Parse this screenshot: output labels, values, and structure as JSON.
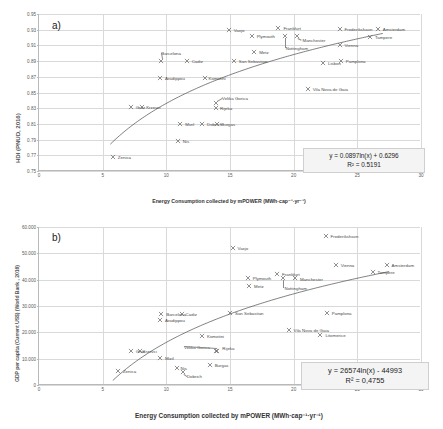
{
  "figure": {
    "width": 443,
    "height": 429,
    "background": "#ffffff",
    "marker_color": "#6b6b6b",
    "curve_color": "#4a4a4a",
    "grid_color": "#d9d9d9"
  },
  "chart_data": [
    {
      "type": "scatter",
      "panel": "a)",
      "title": "",
      "xlabel": "Energy Consumption collected by mPOWER  (MWh·cap⁻¹·yr⁻¹)",
      "ylabel": "HDI (PNUD, 2016)",
      "xlim": [
        0,
        30
      ],
      "ylim": [
        0.75,
        0.95
      ],
      "xticks": [
        0,
        5,
        10,
        15,
        20,
        25,
        30
      ],
      "yticks": [
        0.75,
        0.77,
        0.79,
        0.81,
        0.83,
        0.85,
        0.87,
        0.89,
        0.91,
        0.93,
        0.95
      ],
      "ytick_labels": [
        "0.75",
        "0.77",
        "0.79",
        "0.81",
        "0.83",
        "0.85",
        "0.87",
        "0.89",
        "0.91",
        "0.93",
        "0.95"
      ],
      "grid": true,
      "legend": "none",
      "trend": {
        "kind": "logarithmic",
        "a": 0.0897,
        "b": 0.6296,
        "equation": "y = 0.0897ln(x) + 0.6296",
        "r2_label": "R² = 0.5191",
        "r2": 0.5191,
        "x_start": 5.6,
        "x_end": 27.0
      },
      "points": [
        {
          "label": "Zenica",
          "x": 5.8,
          "y": 0.768,
          "lab_dx": 5,
          "lab_dy": 0
        },
        {
          "label": "Graz",
          "x": 7.2,
          "y": 0.831,
          "lab_dx": 5,
          "lab_dy": 0
        },
        {
          "label": "Krzevci",
          "x": 8.1,
          "y": 0.831,
          "lab_dx": 4,
          "lab_dy": 0
        },
        {
          "label": "Mizil",
          "x": 11.1,
          "y": 0.81,
          "lab_dx": 5,
          "lab_dy": 0
        },
        {
          "label": "Nis",
          "x": 10.9,
          "y": 0.788,
          "lab_dx": 5,
          "lab_dy": 0
        },
        {
          "label": "Dobrich",
          "x": 12.8,
          "y": 0.81,
          "lab_dx": 5,
          "lab_dy": 0
        },
        {
          "label": "Burgas",
          "x": 14.0,
          "y": 0.81,
          "lab_dx": 4,
          "lab_dy": 0
        },
        {
          "label": "Rijeka",
          "x": 13.9,
          "y": 0.83,
          "lab_dx": 4,
          "lab_dy": 0
        },
        {
          "label": "Velika Gorica",
          "x": 13.9,
          "y": 0.836,
          "lab_dx": 6,
          "lab_dy": -5
        },
        {
          "label": "Aradippou",
          "x": 9.5,
          "y": 0.869,
          "lab_dx": 5,
          "lab_dy": 0
        },
        {
          "label": "Komotini",
          "x": 13.0,
          "y": 0.869,
          "lab_dx": 4,
          "lab_dy": 0
        },
        {
          "label": "Barcelona",
          "x": 9.6,
          "y": 0.89,
          "lab_dx": 0,
          "lab_dy": -8
        },
        {
          "label": "Cadiz",
          "x": 11.6,
          "y": 0.89,
          "lab_dx": 5,
          "lab_dy": 0
        },
        {
          "label": "San Sebastian",
          "x": 15.3,
          "y": 0.89,
          "lab_dx": 5,
          "lab_dy": 0
        },
        {
          "label": "Metz",
          "x": 16.9,
          "y": 0.901,
          "lab_dx": 5,
          "lab_dy": 0
        },
        {
          "label": "Vaxjo",
          "x": 14.9,
          "y": 0.93,
          "lab_dx": 5,
          "lab_dy": 0
        },
        {
          "label": "Frankfurt",
          "x": 18.8,
          "y": 0.932,
          "lab_dx": 5,
          "lab_dy": 0
        },
        {
          "label": "Plymouth",
          "x": 16.7,
          "y": 0.922,
          "lab_dx": 5,
          "lab_dy": 0
        },
        {
          "label": "Nottingham",
          "x": 19.3,
          "y": 0.922,
          "lab_dx": 1,
          "lab_dy": 12
        },
        {
          "label": "Manchester",
          "x": 20.3,
          "y": 0.922,
          "lab_dx": 5,
          "lab_dy": 4
        },
        {
          "label": "Frederikshavn",
          "x": 23.6,
          "y": 0.931,
          "lab_dx": 5,
          "lab_dy": 0
        },
        {
          "label": "Amsterdam",
          "x": 26.6,
          "y": 0.931,
          "lab_dx": 5,
          "lab_dy": 0
        },
        {
          "label": "Tampere",
          "x": 26.0,
          "y": 0.921,
          "lab_dx": 5,
          "lab_dy": 0
        },
        {
          "label": "Vienna",
          "x": 23.6,
          "y": 0.91,
          "lab_dx": 5,
          "lab_dy": 0
        },
        {
          "label": "Pamplona",
          "x": 23.7,
          "y": 0.89,
          "lab_dx": 5,
          "lab_dy": 0
        },
        {
          "label": "Lisbon",
          "x": 22.3,
          "y": 0.888,
          "lab_dx": 5,
          "lab_dy": 0
        },
        {
          "label": "Vila Nova de Gaia",
          "x": 21.1,
          "y": 0.855,
          "lab_dx": 5,
          "lab_dy": 0
        }
      ]
    },
    {
      "type": "scatter",
      "panel": "b)",
      "title": "",
      "xlabel": "Energy Consumption collected by mPOWER  (MWh·cap⁻¹·yr⁻¹)",
      "ylabel": "GDP per capita (Current US$) (World Bank , 2016)",
      "xlim": [
        0,
        30
      ],
      "ylim": [
        0,
        60000
      ],
      "xticks": [
        0,
        5,
        10,
        15,
        20,
        25,
        30
      ],
      "yticks": [
        0,
        10000,
        20000,
        30000,
        40000,
        50000,
        60000
      ],
      "ytick_labels": [
        "0",
        "10.000",
        "20.000",
        "30.000",
        "40.000",
        "50.000",
        "60.000"
      ],
      "grid": true,
      "legend": "none",
      "trend": {
        "kind": "logarithmic",
        "a": 26574,
        "b": -44993,
        "equation": "y = 26574ln(x) - 44993",
        "r2_label": "R² = 0,4755",
        "r2": 0.4755,
        "x_start": 5.8,
        "x_end": 27.5
      },
      "points": [
        {
          "label": "Zenica",
          "x": 6.2,
          "y": 5200,
          "lab_dx": 5,
          "lab_dy": 0
        },
        {
          "label": "Graz",
          "x": 7.2,
          "y": 13000,
          "lab_dx": 5,
          "lab_dy": 0
        },
        {
          "label": "Krzevci",
          "x": 7.9,
          "y": 13000,
          "lab_dx": 3,
          "lab_dy": 0
        },
        {
          "label": "Mizil",
          "x": 9.5,
          "y": 10200,
          "lab_dx": 5,
          "lab_dy": 0
        },
        {
          "label": "Nis",
          "x": 10.8,
          "y": 6300,
          "lab_dx": 4,
          "lab_dy": 0
        },
        {
          "label": "Dobrich",
          "x": 11.3,
          "y": 5000,
          "lab_dx": 4,
          "lab_dy": 4
        },
        {
          "label": "Burgas",
          "x": 13.4,
          "y": 7600,
          "lab_dx": 5,
          "lab_dy": 0
        },
        {
          "label": "Rijeka",
          "x": 14.0,
          "y": 12800,
          "lab_dx": 5,
          "lab_dy": -3
        },
        {
          "label": "Velika Gorica",
          "x": 13.9,
          "y": 12800,
          "lab_dx": -32,
          "lab_dy": -4
        },
        {
          "label": "Komotini",
          "x": 12.8,
          "y": 18600,
          "lab_dx": 5,
          "lab_dy": 0
        },
        {
          "label": "Aradippou",
          "x": 9.5,
          "y": 24500,
          "lab_dx": 5,
          "lab_dy": 0
        },
        {
          "label": "Barcelona",
          "x": 9.6,
          "y": 27000,
          "lab_dx": 5,
          "lab_dy": 0
        },
        {
          "label": "Cadiz",
          "x": 11.2,
          "y": 27000,
          "lab_dx": 4,
          "lab_dy": 0
        },
        {
          "label": "San Sebastian",
          "x": 15.0,
          "y": 27200,
          "lab_dx": 5,
          "lab_dy": 0
        },
        {
          "label": "Vaxjo",
          "x": 15.2,
          "y": 52200,
          "lab_dx": 5,
          "lab_dy": 0
        },
        {
          "label": "Metz",
          "x": 16.5,
          "y": 37600,
          "lab_dx": 5,
          "lab_dy": 0
        },
        {
          "label": "Plymouth",
          "x": 16.4,
          "y": 40600,
          "lab_dx": 5,
          "lab_dy": 0
        },
        {
          "label": "Frankfurt",
          "x": 18.7,
          "y": 42000,
          "lab_dx": 5,
          "lab_dy": 0
        },
        {
          "label": "Nottingham",
          "x": 19.2,
          "y": 40600,
          "lab_dx": 1,
          "lab_dy": 10
        },
        {
          "label": "Manchester",
          "x": 20.1,
          "y": 40600,
          "lab_dx": 5,
          "lab_dy": 1
        },
        {
          "label": "Frederikshavn",
          "x": 22.5,
          "y": 56600,
          "lab_dx": 5,
          "lab_dy": 0
        },
        {
          "label": "Vienna",
          "x": 23.3,
          "y": 45600,
          "lab_dx": 5,
          "lab_dy": 0
        },
        {
          "label": "Amsterdam",
          "x": 27.3,
          "y": 45600,
          "lab_dx": 5,
          "lab_dy": 0
        },
        {
          "label": "Tampere",
          "x": 26.2,
          "y": 43000,
          "lab_dx": 5,
          "lab_dy": 0
        },
        {
          "label": "Pamplona",
          "x": 22.6,
          "y": 27200,
          "lab_dx": 5,
          "lab_dy": 0
        },
        {
          "label": "Vila Nova de Gaia",
          "x": 19.6,
          "y": 20800,
          "lab_dx": 5,
          "lab_dy": 0
        },
        {
          "label": "Litomerice",
          "x": 22.1,
          "y": 18800,
          "lab_dx": 5,
          "lab_dy": 0
        }
      ]
    }
  ]
}
